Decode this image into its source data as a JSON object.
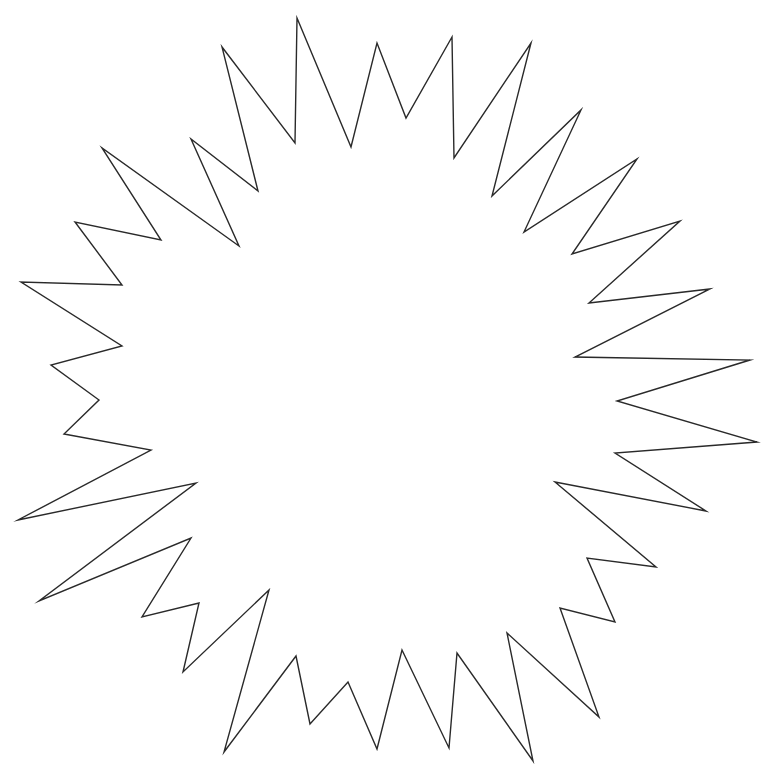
{
  "drawing": {
    "subject": "starburst outline",
    "canvas": {
      "width": 774,
      "height": 774,
      "background": "#ffffff"
    },
    "stroke_color": "#2a2a2a",
    "stroke_width": 1.4,
    "fill": "none",
    "vertices": [
      [
        297,
        18
      ],
      [
        351,
        147
      ],
      [
        377,
        43
      ],
      [
        406,
        118
      ],
      [
        452,
        37
      ],
      [
        454,
        158
      ],
      [
        531,
        43
      ],
      [
        492,
        196
      ],
      [
        581,
        110
      ],
      [
        524,
        232
      ],
      [
        637,
        159
      ],
      [
        572,
        254
      ],
      [
        680,
        221
      ],
      [
        589,
        303
      ],
      [
        710,
        289
      ],
      [
        575,
        357
      ],
      [
        750,
        360
      ],
      [
        617,
        401
      ],
      [
        757,
        442
      ],
      [
        615,
        453
      ],
      [
        706,
        511
      ],
      [
        555,
        482
      ],
      [
        656,
        567
      ],
      [
        587,
        558
      ],
      [
        615,
        622
      ],
      [
        560,
        608
      ],
      [
        599,
        717
      ],
      [
        507,
        633
      ],
      [
        533,
        761
      ],
      [
        457,
        653
      ],
      [
        449,
        748
      ],
      [
        402,
        650
      ],
      [
        377,
        749
      ],
      [
        348,
        682
      ],
      [
        310,
        724
      ],
      [
        296,
        656
      ],
      [
        224,
        752
      ],
      [
        269,
        590
      ],
      [
        183,
        672
      ],
      [
        199,
        603
      ],
      [
        142,
        617
      ],
      [
        191,
        538
      ],
      [
        39,
        601
      ],
      [
        196,
        483
      ],
      [
        18,
        520
      ],
      [
        151,
        450
      ],
      [
        64,
        434
      ],
      [
        99,
        400
      ],
      [
        51,
        365
      ],
      [
        122,
        346
      ],
      [
        21,
        282
      ],
      [
        122,
        285
      ],
      [
        75,
        222
      ],
      [
        161,
        240
      ],
      [
        102,
        148
      ],
      [
        239,
        246
      ],
      [
        191,
        139
      ],
      [
        258,
        191
      ],
      [
        222,
        47
      ],
      [
        295,
        143
      ]
    ]
  }
}
